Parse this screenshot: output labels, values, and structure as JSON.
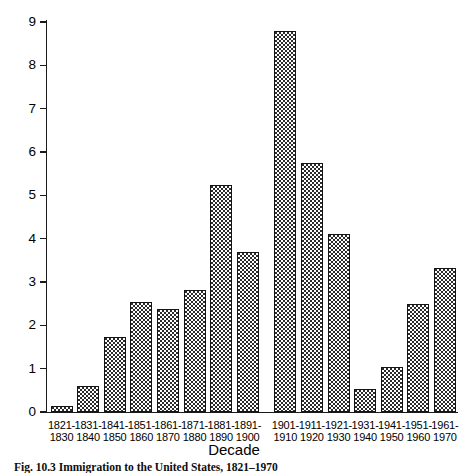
{
  "chart_data": {
    "type": "bar",
    "title": "",
    "caption": "Fig. 10.3 Immigration to the United States, 1821–1970",
    "xlabel": "Decade",
    "ylabel": "",
    "ylim": [
      0,
      9
    ],
    "ytick_labels": [
      "0",
      "1",
      "2",
      "3",
      "4",
      "5",
      "6",
      "7",
      "8",
      "9"
    ],
    "yticks": [
      0,
      1,
      2,
      3,
      4,
      5,
      6,
      7,
      8,
      9
    ],
    "grid": false,
    "legend": false,
    "categories": [
      "1821-\n1830",
      "1831-\n1840",
      "1841-\n1850",
      "1851-\n1860",
      "1861-\n1870",
      "1871-\n1880",
      "1881-\n1890",
      "1891-\n1900",
      "1901-\n1910",
      "1911-\n1920",
      "1921-\n1930",
      "1931-\n1940",
      "1941-\n1950",
      "1951-\n1960",
      "1961-\n1970"
    ],
    "values": [
      0.15,
      0.6,
      1.73,
      2.53,
      2.37,
      2.81,
      5.25,
      3.69,
      8.8,
      5.74,
      4.11,
      0.53,
      1.04,
      2.5,
      3.32
    ],
    "bars": [
      {
        "label_top": "1821-",
        "label_bottom": "1830",
        "value": 0.15
      },
      {
        "label_top": "1831-",
        "label_bottom": "1840",
        "value": 0.6
      },
      {
        "label_top": "1841-",
        "label_bottom": "1850",
        "value": 1.73
      },
      {
        "label_top": "1851-",
        "label_bottom": "1860",
        "value": 2.53
      },
      {
        "label_top": "1861-",
        "label_bottom": "1870",
        "value": 2.37
      },
      {
        "label_top": "1871-",
        "label_bottom": "1880",
        "value": 2.81
      },
      {
        "label_top": "1881-",
        "label_bottom": "1890",
        "value": 5.25
      },
      {
        "label_top": "1891-",
        "label_bottom": "1900",
        "value": 3.69
      },
      {
        "label_top": "1901-",
        "label_bottom": "1910",
        "value": 8.8
      },
      {
        "label_top": "1911-",
        "label_bottom": "1920",
        "value": 5.74
      },
      {
        "label_top": "1921-",
        "label_bottom": "1930",
        "value": 4.11
      },
      {
        "label_top": "1931-",
        "label_bottom": "1940",
        "value": 0.53
      },
      {
        "label_top": "1941-",
        "label_bottom": "1950",
        "value": 1.04
      },
      {
        "label_top": "1951-",
        "label_bottom": "1960",
        "value": 2.5
      },
      {
        "label_top": "1961-",
        "label_bottom": "1970",
        "value": 3.32
      }
    ],
    "colors": {
      "axis": "#1a1a1a",
      "bar_outline": "#141414",
      "bar_fill": "#ffffff",
      "bar_pattern": "#2b2b2b",
      "background": "#ffffff"
    }
  }
}
